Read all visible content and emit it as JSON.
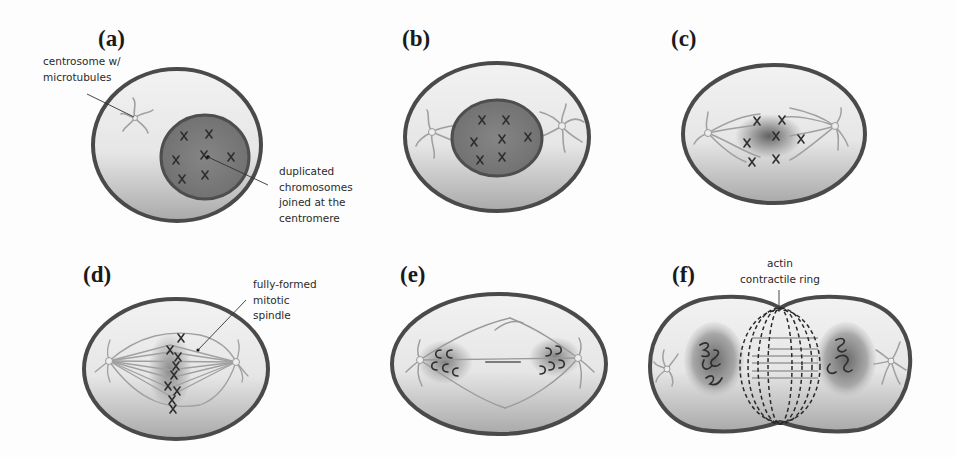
{
  "figure": {
    "colors": {
      "membrane": "#4a4a4a",
      "cytoplasm_light": "#efefef",
      "cytoplasm_dark": "#a8a8a8",
      "nucleus": "#7a7a7a",
      "microtubule": "#9a9a9a",
      "chromosome": "#2e2e2e"
    },
    "panels": [
      {
        "id": "a",
        "label": "(a)",
        "callout": [
          "centrosome w/",
          "microtubules"
        ],
        "callout2": [
          "duplicated",
          "chromosomes",
          "joined at the",
          "centromere"
        ]
      },
      {
        "id": "b",
        "label": "(b)"
      },
      {
        "id": "c",
        "label": "(c)"
      },
      {
        "id": "d",
        "label": "(d)",
        "callout": [
          "fully-formed",
          "mitotic",
          "spindle"
        ]
      },
      {
        "id": "e",
        "label": "(e)"
      },
      {
        "id": "f",
        "label": "(f)",
        "callout": [
          "actin",
          "contractile ring"
        ]
      }
    ]
  }
}
